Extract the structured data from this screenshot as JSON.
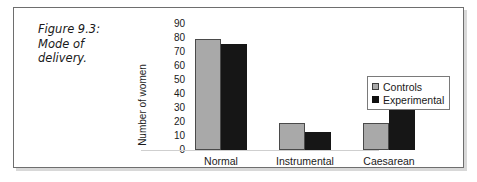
{
  "figure": {
    "caption_lines": [
      "Figure 9.3:",
      "Mode of",
      "delivery."
    ]
  },
  "chart_data": {
    "type": "bar",
    "title": "",
    "xlabel": "",
    "ylabel": "Number of women",
    "categories": [
      "Normal",
      "Instrumental",
      "Caesarean"
    ],
    "series": [
      {
        "name": "Controls",
        "color": "#a9a9a9",
        "values": [
          79,
          19,
          19
        ]
      },
      {
        "name": "Experimental",
        "color": "#161616",
        "values": [
          76,
          13,
          29
        ]
      }
    ],
    "ylim": [
      0,
      90
    ],
    "ytick_values": [
      90,
      80,
      70,
      60,
      50,
      40,
      30,
      20,
      10,
      0
    ],
    "ytick_labels": [
      "90",
      "80",
      "70",
      "60",
      "50",
      "40",
      "30",
      "20",
      "10",
      "0"
    ],
    "grid": false,
    "legend_position": "right"
  }
}
